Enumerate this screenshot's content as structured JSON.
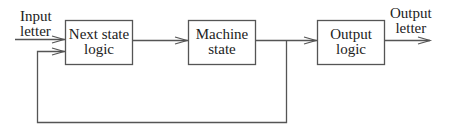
{
  "diagram": {
    "type": "block-diagram",
    "input": {
      "line1": "Input",
      "line2": "letter"
    },
    "output": {
      "line1": "Output",
      "line2": "letter"
    },
    "blocks": [
      {
        "id": "next-state-logic",
        "line1": "Next state",
        "line2": "logic"
      },
      {
        "id": "machine-state",
        "line1": "Machine",
        "line2": "state"
      },
      {
        "id": "output-logic",
        "line1": "Output",
        "line2": "logic"
      }
    ],
    "edges": [
      {
        "from": "input",
        "to": "next-state-logic"
      },
      {
        "from": "next-state-logic",
        "to": "machine-state"
      },
      {
        "from": "machine-state",
        "to": "output-logic"
      },
      {
        "from": "output-logic",
        "to": "output"
      },
      {
        "from": "machine-state",
        "to": "next-state-logic",
        "kind": "feedback"
      }
    ],
    "stroke_color": "#555555"
  }
}
